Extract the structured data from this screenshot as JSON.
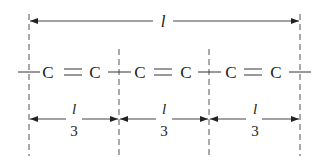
{
  "diagram": {
    "total_length_label": "l",
    "chain": {
      "atoms": [
        "C",
        "C",
        "C",
        "C",
        "C",
        "C"
      ],
      "bond_label": "="
    },
    "segments": [
      {
        "numerator": "l",
        "denominator": "3"
      },
      {
        "numerator": "l",
        "denominator": "3"
      },
      {
        "numerator": "l",
        "denominator": "3"
      }
    ],
    "colors": {
      "line": "#333333",
      "dash": "#555555",
      "text": "#222222"
    }
  }
}
